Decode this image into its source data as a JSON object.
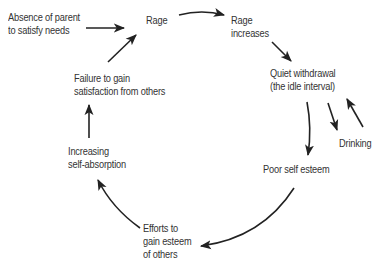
{
  "diagram": {
    "type": "cycle",
    "stroke_color": "#222222",
    "text_color": "#333333",
    "nodes": [
      {
        "id": "absence",
        "lines": [
          "Absence of parent",
          "to satisfy needs"
        ]
      },
      {
        "id": "rage",
        "lines": [
          "Rage"
        ]
      },
      {
        "id": "rage_increases",
        "lines": [
          "Rage",
          "increases"
        ]
      },
      {
        "id": "quiet_withdrawal",
        "lines": [
          "Quiet withdrawal",
          "(the idle interval)"
        ]
      },
      {
        "id": "drinking",
        "lines": [
          "Drinking"
        ]
      },
      {
        "id": "poor_self_esteem",
        "lines": [
          "Poor self esteem"
        ]
      },
      {
        "id": "efforts",
        "lines": [
          "Efforts to",
          "gain esteem",
          "of others"
        ]
      },
      {
        "id": "self_absorption",
        "lines": [
          "Increasing",
          "self-absorption"
        ]
      },
      {
        "id": "failure",
        "lines": [
          "Failure to gain",
          "satisfaction from others"
        ]
      }
    ],
    "edges": [
      {
        "from": "absence",
        "to": "rage"
      },
      {
        "from": "rage",
        "to": "rage_increases"
      },
      {
        "from": "rage_increases",
        "to": "quiet_withdrawal"
      },
      {
        "from": "quiet_withdrawal",
        "to": "poor_self_esteem"
      },
      {
        "from": "quiet_withdrawal",
        "to": "drinking"
      },
      {
        "from": "drinking",
        "to": "quiet_withdrawal"
      },
      {
        "from": "poor_self_esteem",
        "to": "efforts"
      },
      {
        "from": "efforts",
        "to": "self_absorption"
      },
      {
        "from": "self_absorption",
        "to": "failure"
      },
      {
        "from": "failure",
        "to": "rage"
      }
    ]
  }
}
